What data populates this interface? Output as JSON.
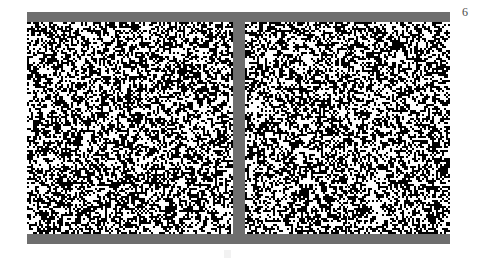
{
  "page": {
    "number_label": "6",
    "background_color": "#ffffff",
    "width": 478,
    "height": 262
  },
  "figure": {
    "name": "random-dot-stereogram-pair",
    "frame_color": "#6e6e6e",
    "bars": [
      {
        "name": "top-bar",
        "label": ""
      },
      {
        "name": "bottom-bar",
        "label": ""
      },
      {
        "name": "center-divider",
        "label": ""
      }
    ],
    "panels": [
      {
        "name": "left-noise-panel",
        "label": "",
        "seed": 20240601,
        "density": 0.5,
        "cell_size": 2,
        "foreground_color": "#000000",
        "background_color": "#ffffff"
      },
      {
        "name": "right-noise-panel",
        "label": "",
        "seed": 77310945,
        "density": 0.5,
        "cell_size": 2,
        "foreground_color": "#000000",
        "background_color": "#ffffff"
      }
    ]
  },
  "artifacts": {
    "scan_mark_label": ""
  }
}
